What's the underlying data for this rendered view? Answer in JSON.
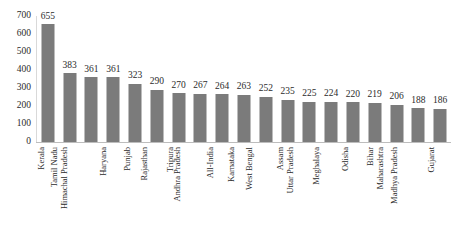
{
  "chart_data": {
    "type": "bar",
    "title": "",
    "subtitle": "",
    "xlabel": "",
    "ylabel": "",
    "ylim": [
      0,
      700
    ],
    "ytick_step": 100,
    "yticks": [
      "0",
      "100",
      "200",
      "300",
      "400",
      "500",
      "600",
      "700"
    ],
    "grid": false,
    "legend": false,
    "legend_position": "none",
    "bar_color": "#7b7b7b",
    "axis_color": "#bdbdbd",
    "text_color": "#2b2b2b",
    "categories": [
      "Kerala",
      "Tamil Nadu",
      "Himachal Pradesh",
      "Haryana",
      "Punjab",
      "Rajasthan",
      "Tripura",
      "Andhra Pradesh",
      "All-India",
      "Karnataka",
      "West Bengal",
      "Assam",
      "Uttar Pradesh",
      "Meghalaya",
      "Odisha",
      "Bihar",
      "Maharashtra",
      "Madhya Pradesh",
      "Gujarat"
    ],
    "values": [
      655,
      383,
      361,
      361,
      323,
      290,
      270,
      267,
      264,
      263,
      252,
      235,
      225,
      224,
      220,
      219,
      206,
      188,
      186
    ],
    "data_labels": [
      "655",
      "383",
      "361",
      "361",
      "323",
      "290",
      "270",
      "267",
      "264",
      "263",
      "252",
      "235",
      "225",
      "224",
      "220",
      "219",
      "206",
      "188",
      "186"
    ]
  }
}
